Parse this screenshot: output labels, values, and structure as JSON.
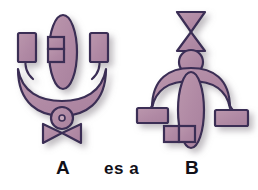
{
  "canvas": {
    "width": 258,
    "height": 190,
    "background": "#ffffff"
  },
  "palette": {
    "fill": "#b089a4",
    "fill_light": "#bb97ad",
    "stroke": "#3a2d55",
    "shadow": "#b9b4bd",
    "text": "#111018"
  },
  "caption": {
    "left_label": "A",
    "middle_label": "es a",
    "right_label": "B"
  },
  "figures": [
    {
      "id": "figure-a",
      "label": "A",
      "parts": [
        "central-tall-ellipse",
        "left-rectangle",
        "middle-divided-rectangle",
        "right-rectangle",
        "left-arm-curve",
        "right-arm-curve",
        "upward-crescent-bowl",
        "small-circle-with-hole",
        "horizontal-bowtie"
      ]
    },
    {
      "id": "figure-b",
      "label": "B",
      "parts": [
        "top-vertical-hourglass",
        "head-circle",
        "dome-arc",
        "central-tall-ellipse",
        "left-arm-curve",
        "right-arm-curve",
        "left-rectangle",
        "right-rectangle",
        "lower-divided-rectangle"
      ]
    }
  ]
}
